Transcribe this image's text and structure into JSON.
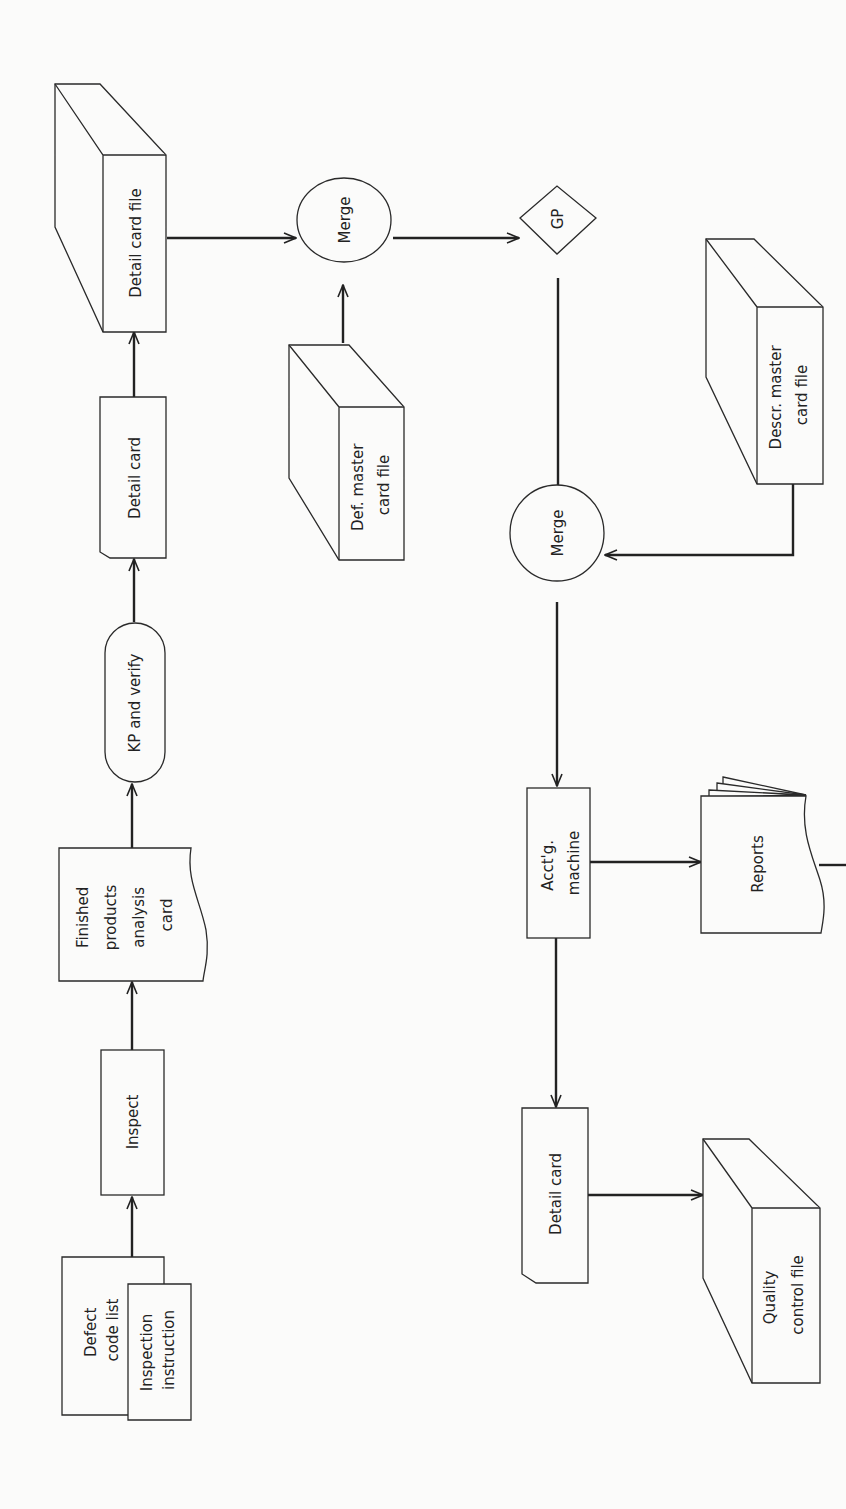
{
  "diagram": {
    "orientation": "rotated 90deg counter-clockwise (text reads bottom-to-top)",
    "nodes": {
      "defect_code_list": {
        "lines": [
          "Defect",
          "code list"
        ],
        "shape": "document"
      },
      "inspection_instruction": {
        "lines": [
          "Inspection",
          "instruction"
        ],
        "shape": "document"
      },
      "inspect": {
        "lines": [
          "Inspect"
        ],
        "shape": "process"
      },
      "finished_products_card": {
        "lines": [
          "Finished",
          "products",
          "analysis",
          "card"
        ],
        "shape": "document-wavy"
      },
      "kp_verify": {
        "lines": [
          "KP and verify"
        ],
        "shape": "terminal"
      },
      "detail_card_1": {
        "lines": [
          "Detail card"
        ],
        "shape": "punched-card"
      },
      "detail_card_file": {
        "lines": [
          "Detail card file"
        ],
        "shape": "card-file"
      },
      "merge_1": {
        "lines": [
          "Merge"
        ],
        "shape": "circle"
      },
      "def_master_file": {
        "lines": [
          "Def. master",
          "card file"
        ],
        "shape": "card-file"
      },
      "gp": {
        "lines": [
          "GP"
        ],
        "shape": "diamond"
      },
      "merge_2": {
        "lines": [
          "Merge"
        ],
        "shape": "circle"
      },
      "descr_master_file": {
        "lines": [
          "Descr. master",
          "card file"
        ],
        "shape": "card-file"
      },
      "acctg_machine": {
        "lines": [
          "Acct'g.",
          "machine"
        ],
        "shape": "process"
      },
      "reports": {
        "lines": [
          "Reports"
        ],
        "shape": "multi-document"
      },
      "detail_card_2": {
        "lines": [
          "Detail card"
        ],
        "shape": "punched-card"
      },
      "quality_control_file": {
        "lines": [
          "Quality",
          "control file"
        ],
        "shape": "card-file"
      }
    },
    "edges": [
      [
        "defect_code_list",
        "inspect"
      ],
      [
        "inspect",
        "finished_products_card"
      ],
      [
        "finished_products_card",
        "kp_verify"
      ],
      [
        "kp_verify",
        "detail_card_1"
      ],
      [
        "detail_card_1",
        "detail_card_file"
      ],
      [
        "detail_card_file",
        "merge_1"
      ],
      [
        "def_master_file",
        "merge_1"
      ],
      [
        "merge_1",
        "gp"
      ],
      [
        "gp",
        "merge_2"
      ],
      [
        "descr_master_file",
        "merge_2"
      ],
      [
        "merge_2",
        "acctg_machine"
      ],
      [
        "acctg_machine",
        "reports"
      ],
      [
        "acctg_machine",
        "detail_card_2"
      ],
      [
        "detail_card_2",
        "quality_control_file"
      ]
    ],
    "colors": {
      "line": "#222222",
      "background": "#fbfbfa"
    }
  }
}
